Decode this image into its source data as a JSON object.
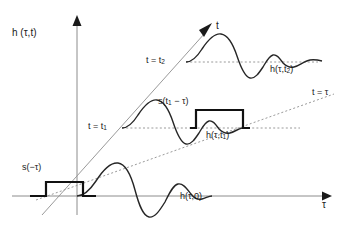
{
  "figure": {
    "background_color": "#ffffff",
    "ink_color": "#1a1a1a",
    "axis_color": "#8c8c8c",
    "wave_color": "#262626",
    "pulse_color": "#111111",
    "dash_color": "#9a9a9a"
  },
  "axes": {
    "vertical": {
      "label_main": "h",
      "label_args": "(τ,t)",
      "label_full": "h (τ,t)",
      "origin_x": 77,
      "top_y": 18,
      "bottom_y": 215
    },
    "horizontal": {
      "label": "τ",
      "y": 196,
      "left_x": 12,
      "right_x": 325
    },
    "diagonal_t": {
      "label": "t",
      "start_x": 42,
      "start_y": 215,
      "end_x": 212,
      "end_y": 28
    }
  },
  "lines": {
    "t_equals_tau": {
      "label": "t = τ",
      "style": "dashed",
      "start_x": 36,
      "start_y": 200,
      "end_x": 330,
      "end_y": 96
    },
    "level_t1": {
      "label": "t = t₁",
      "label_main": "t = t",
      "label_sub": "1",
      "style": "dashed",
      "y": 128
    },
    "level_t2": {
      "label": "t = t₂",
      "label_main": "t = t",
      "label_sub": "2",
      "style": "dashed",
      "y": 62
    }
  },
  "labels": {
    "y_axis": "h (τ,t)",
    "t_axis": "t",
    "tau_axis": "τ",
    "t_eq_t2": "t = t",
    "t_eq_t2_sub": "2",
    "t_eq_t1": "t = t",
    "t_eq_t1_sub": "1",
    "t_eq_tau": "t = τ",
    "s_minus_tau": "s(−τ)",
    "s_t1_minus_tau": "s(t",
    "s_t1_minus_tau_sub": "1",
    "s_t1_minus_tau_rest": " − τ)",
    "h_tau_0": "h(τ,0)",
    "h_tau_t1": "h(τ,t",
    "h_tau_t1_sub": "1",
    "h_tau_t1_rest": ")",
    "h_tau_t2": "h(τ,t",
    "h_tau_t2_sub": "2",
    "h_tau_t2_rest": ")"
  },
  "waveforms": [
    {
      "name": "h(τ,0)",
      "baseline_y": 196,
      "description": "damped oscillation along tau axis at t = 0",
      "label_x": 182,
      "label_y": 197
    },
    {
      "name": "h(τ,t₁)",
      "baseline_y": 128,
      "description": "damped oscillation at t = t1 shifted right",
      "label_x": 207,
      "label_y": 137
    },
    {
      "name": "h(τ,t₂)",
      "baseline_y": 62,
      "description": "damped oscillation at t = t2 shifted further right",
      "label_x": 272,
      "label_y": 70
    }
  ],
  "pulses": [
    {
      "name": "s(−τ)",
      "baseline_y": 196,
      "left_x": 46,
      "right_x": 83,
      "top_y": 182,
      "label_x": 24,
      "label_y": 167
    },
    {
      "name": "s(t₁ − τ)",
      "baseline_y": 128,
      "left_x": 196,
      "right_x": 243,
      "top_y": 110,
      "label_x": 160,
      "label_y": 99
    }
  ]
}
